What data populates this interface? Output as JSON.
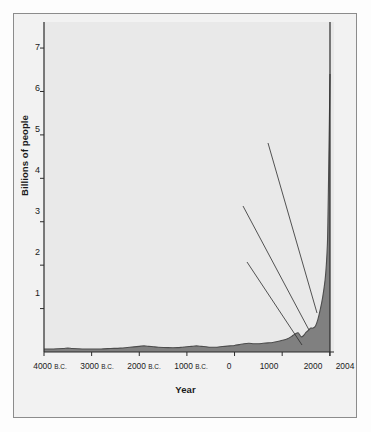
{
  "figure": {
    "background_color": "#fdfdfd",
    "plot_background_color": "#e9e9e9",
    "frame_color": "#8c8c8c",
    "area_fill_color": "#808080",
    "area_line_color": "#4d4d4d",
    "leader_line_color": "#2b2b2b"
  },
  "chart_data": {
    "type": "area",
    "title": "",
    "xlabel": "Year",
    "ylabel": "Billions of people",
    "xlim": [
      -4000,
      2004
    ],
    "ylim": [
      0,
      7.6
    ],
    "grid": false,
    "legend": null,
    "ytick_labels": [
      "1",
      "2",
      "3",
      "4",
      "5",
      "6",
      "7"
    ],
    "ytick_values": [
      1,
      2,
      3,
      4,
      5,
      6,
      7
    ],
    "xtick_labels": [
      "4000 B.C.",
      "3000 B.C.",
      "2000 B.C.",
      "1000 B.C.",
      "0",
      "1000",
      "2000",
      "2004"
    ],
    "xtick_values": [
      -4000,
      -3000,
      -2000,
      -1000,
      0,
      1000,
      2000,
      2004
    ],
    "series_name": "World population",
    "x": [
      -4000,
      -3800,
      -3600,
      -3500,
      -3400,
      -3200,
      -3000,
      -2800,
      -2600,
      -2400,
      -2200,
      -2000,
      -1900,
      -1800,
      -1700,
      -1600,
      -1400,
      -1200,
      -1100,
      -1000,
      -900,
      -800,
      -700,
      -600,
      -500,
      -400,
      -300,
      -200,
      -100,
      0,
      100,
      200,
      300,
      400,
      500,
      600,
      700,
      800,
      900,
      1000,
      1100,
      1200,
      1250,
      1300,
      1340,
      1400,
      1450,
      1500,
      1550,
      1600,
      1650,
      1700,
      1750,
      1800,
      1850,
      1900,
      1927,
      1950,
      1960,
      1974,
      1987,
      1999,
      2004
    ],
    "y": [
      0.07,
      0.07,
      0.08,
      0.09,
      0.08,
      0.07,
      0.07,
      0.07,
      0.08,
      0.09,
      0.11,
      0.13,
      0.14,
      0.13,
      0.12,
      0.11,
      0.1,
      0.1,
      0.11,
      0.12,
      0.13,
      0.14,
      0.13,
      0.12,
      0.11,
      0.11,
      0.12,
      0.13,
      0.14,
      0.15,
      0.17,
      0.19,
      0.2,
      0.19,
      0.19,
      0.2,
      0.21,
      0.22,
      0.24,
      0.27,
      0.3,
      0.36,
      0.4,
      0.43,
      0.44,
      0.35,
      0.38,
      0.45,
      0.5,
      0.55,
      0.55,
      0.6,
      0.75,
      0.98,
      1.26,
      1.65,
      2.0,
      2.5,
      3.0,
      4.0,
      5.0,
      6.0,
      6.4
    ],
    "annotations": [
      {
        "id": "significant-advances",
        "text": "Significant advances\nin medicine through\nscience and\ntechnology",
        "label_x_px": 168,
        "label_y_px": 140,
        "leader_from_px": [
          268,
          143
        ],
        "leader_to_px": [
          317,
          313
        ]
      },
      {
        "id": "industrial-revolution",
        "text": "Industrial\nrevolution",
        "label_x_px": 192,
        "label_y_px": 203,
        "leader_from_px": [
          243,
          206
        ],
        "leader_to_px": [
          309,
          330
        ]
      },
      {
        "id": "bubonic-plague",
        "text": "Bubonic plague\n\"Black Death\"",
        "label_x_px": 172,
        "label_y_px": 259,
        "leader_from_px": [
          247,
          262
        ],
        "leader_to_px": [
          302,
          345
        ]
      }
    ]
  }
}
